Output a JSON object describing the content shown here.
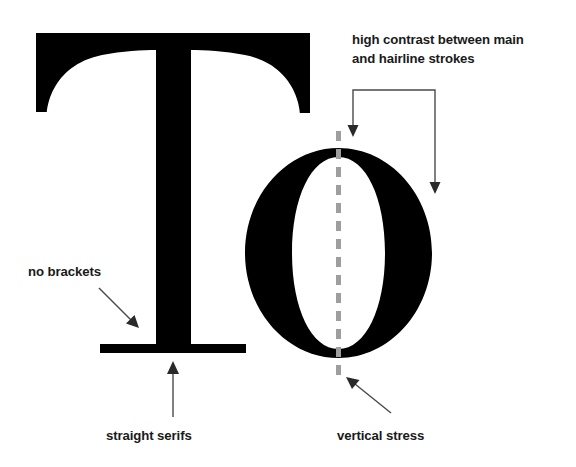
{
  "diagram": {
    "background_color": "#ffffff",
    "glyph_color": "#000000",
    "sample_text": "To",
    "annotations": [
      {
        "id": "high-contrast",
        "line1": "high contrast between main",
        "line2": "and hairline strokes",
        "target": "stroke weight contrast",
        "connector": "bracket-two-arrows"
      },
      {
        "id": "no-brackets",
        "line1": "no brackets",
        "line2": "",
        "target": "T stem to serif junction",
        "connector": "diagonal-arrow-down-right"
      },
      {
        "id": "straight-serifs",
        "line1": "straight serifs",
        "line2": "",
        "target": "T foot serif",
        "connector": "vertical-arrow-up"
      },
      {
        "id": "vertical-stress",
        "line1": "vertical stress",
        "line2": "",
        "target": "o stress axis",
        "connector": "diagonal-arrow-up-left"
      }
    ],
    "stress_axis": {
      "label": "vertical stress axis",
      "color": "#9e9e9e",
      "style": "dashed"
    },
    "leader_color": "#4a4a4a",
    "text_color": "#1a1a1a"
  }
}
